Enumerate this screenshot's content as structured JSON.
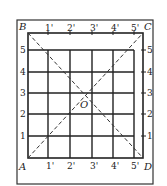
{
  "diagram": {
    "title": "",
    "corners": {
      "A": "A",
      "B": "B",
      "C": "C",
      "D": "D"
    },
    "center": "O",
    "top_ticks": [
      "1'",
      "2'",
      "3'",
      "4'",
      "5'"
    ],
    "bottom_ticks": [
      "1'",
      "2'",
      "3'",
      "4'",
      "5'"
    ],
    "left_ticks": [
      "1",
      "2",
      "3",
      "4",
      "5"
    ],
    "right_ticks": [
      "1",
      "2",
      "3",
      "4",
      "5"
    ],
    "colors": {
      "line": "#222222",
      "background": "#ffffff"
    }
  }
}
